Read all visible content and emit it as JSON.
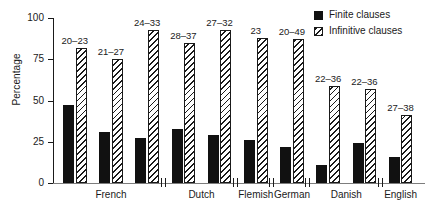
{
  "chart_data": {
    "type": "bar",
    "title": "",
    "xlabel": "",
    "ylabel": "Percentage",
    "ylim": [
      0,
      100
    ],
    "yticks": [
      0,
      25,
      50,
      75,
      100
    ],
    "ytick_labels": [
      "0",
      "25",
      "50",
      "75",
      "100"
    ],
    "grid": false,
    "legend_position": "top-right",
    "categories": [
      "French 1",
      "French 2",
      "French 3",
      "Dutch 1",
      "Dutch 2",
      "Flemish",
      "German",
      "Danish 1",
      "Danish 2",
      "English"
    ],
    "groups": [
      {
        "label": "French",
        "count": 3
      },
      {
        "label": "Dutch",
        "count": 2
      },
      {
        "label": "Flemish",
        "count": 1
      },
      {
        "label": "German",
        "count": 1
      },
      {
        "label": "Danish",
        "count": 2
      },
      {
        "label": "English",
        "count": 1
      }
    ],
    "series": [
      {
        "name": "Finite clauses",
        "values": [
          47,
          31,
          27,
          33,
          29,
          26,
          22,
          11,
          24,
          16
        ]
      },
      {
        "name": "Infinitive clauses",
        "values": [
          82,
          75,
          93,
          85,
          93,
          88,
          87,
          59,
          57,
          41
        ]
      }
    ],
    "annotations": [
      "20–23",
      "21–27",
      "24–33",
      "28–37",
      "27–32",
      "23",
      "20–49",
      "22–36",
      "22–36",
      "27–38"
    ],
    "legend": [
      {
        "key": "finite",
        "label": "Finite clauses"
      },
      {
        "key": "inf",
        "label": "Infinitive clauses"
      }
    ]
  }
}
